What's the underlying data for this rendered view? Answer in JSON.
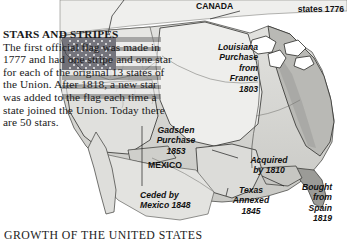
{
  "caption": "GROWTH OF THE UNITED STATES",
  "sidebar_text": {
    "heading": "STARS AND STRIPES",
    "body": "The first official flag was made in 1777 and had one stripe and one star for each of the original 13 states of the Union. After 1818, a new star was added to the flag each time a state joined the Union. Today there are 50 stars."
  },
  "flag": {
    "stripe_count": 13,
    "star_count": 50,
    "canton_color": "#2a2a38",
    "stripe_red": "#7d7d7d",
    "stripe_white": "#f2f2f2"
  },
  "map": {
    "labels": {
      "canada": "CANADA",
      "original_states": "states 1776",
      "louisiana": "Louisiana\nPurchase\nfrom\nFrance\n1803",
      "gadsden": "Gadsden\nPurchase\n1853",
      "mexico": "MEXICO",
      "ceded_by_mexico": "Ceded by\nMexico 1848",
      "acquired_by_1810": "Acquired\nby 1810",
      "texas_annexed": "Texas\nAnnexed\n1845",
      "bought_from_spain": "Bought\nfrom\nSpain\n1819"
    },
    "colors": {
      "land_light": "#e9e9e7",
      "land_mid": "#cfcfcc",
      "land_dark": "#a8a8a4",
      "outline": "#2b2b2b",
      "water": "#ffffff"
    }
  }
}
